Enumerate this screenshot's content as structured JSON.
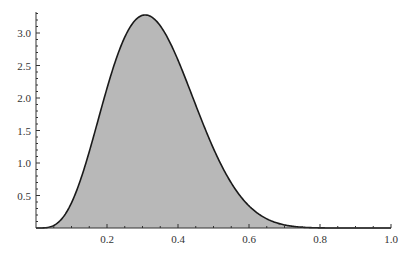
{
  "chart_data": {
    "type": "area",
    "title": "",
    "xlabel": "",
    "ylabel": "",
    "xlim": [
      0,
      1.0
    ],
    "ylim": [
      0,
      3.3
    ],
    "grid": false,
    "legend": null,
    "distribution_hint": "Beta(5,10) probability density",
    "x_ticks": [
      0.2,
      0.4,
      0.6,
      0.8,
      1.0
    ],
    "x_tick_labels": [
      "0.2",
      "0.4",
      "0.6",
      "0.8",
      "1.0"
    ],
    "y_ticks": [
      0.5,
      1.0,
      1.5,
      2.0,
      2.5,
      3.0
    ],
    "y_tick_labels": [
      "0.5",
      "1.0",
      "1.5",
      "2.0",
      "2.5",
      "3.0"
    ],
    "series": [
      {
        "name": "density",
        "x": [
          0.0,
          0.05,
          0.1,
          0.15,
          0.2,
          0.25,
          0.3,
          0.35,
          0.4,
          0.45,
          0.5,
          0.55,
          0.6,
          0.65,
          0.7,
          0.75,
          0.8,
          0.85,
          0.9,
          0.95,
          1.0
        ],
        "values": [
          0.0,
          0.04,
          0.39,
          1.29,
          2.36,
          3.09,
          3.25,
          2.9,
          2.23,
          1.52,
          0.92,
          0.5,
          0.23,
          0.09,
          0.03,
          0.01,
          0.0,
          0.0,
          0.0,
          0.0,
          0.0
        ]
      }
    ],
    "peak": {
      "x": 0.31,
      "y": 3.27
    },
    "colors": {
      "fill": "#b8b8b8",
      "line": "#1a1a1a",
      "axis": "#333333"
    }
  }
}
